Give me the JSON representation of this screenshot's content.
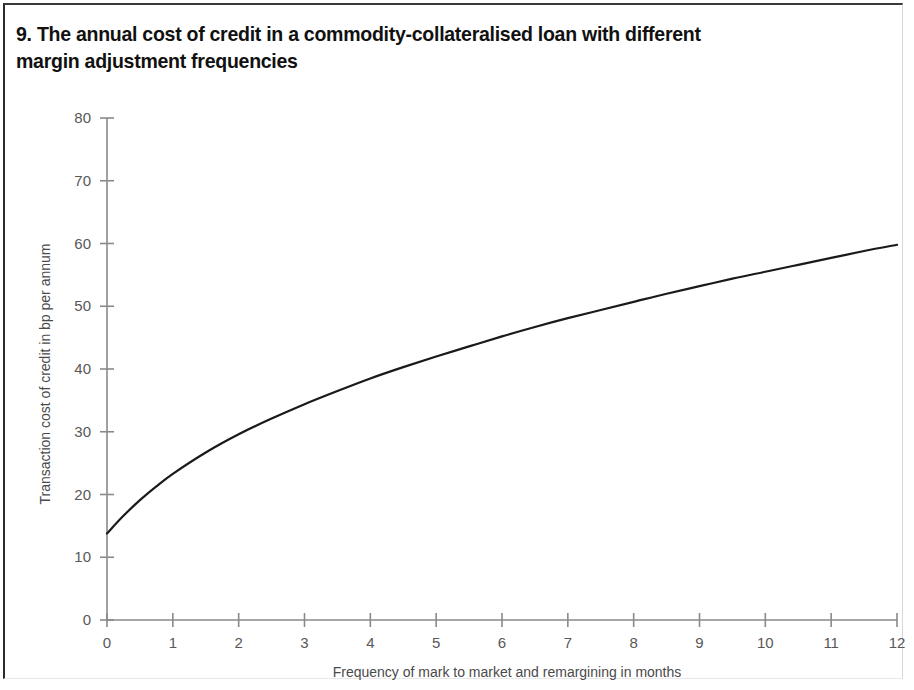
{
  "figure": {
    "title": "9. The annual cost of credit in a commodity-collateralised loan with different margin adjustment frequencies",
    "border_color": "#2b2b2b",
    "background": "#ffffff"
  },
  "chart_data": {
    "type": "line",
    "title": "9. The annual cost of credit in a commodity-collateralised loan with different margin adjustment frequencies",
    "xlabel": "Frequency of mark to market and remargining in months",
    "ylabel": "Transaction cost of credit in bp per  annum",
    "xlim": [
      0,
      12
    ],
    "ylim": [
      0,
      80
    ],
    "xticks": [
      0,
      1,
      2,
      3,
      4,
      5,
      6,
      7,
      8,
      9,
      10,
      11,
      12
    ],
    "yticks": [
      0,
      10,
      20,
      30,
      40,
      50,
      60,
      70,
      80
    ],
    "xtick_labels": [
      "0",
      "1",
      "2",
      "3",
      "4",
      "5",
      "6",
      "7",
      "8",
      "9",
      "10",
      "11",
      "12"
    ],
    "ytick_labels": [
      "0",
      "10",
      "20",
      "30",
      "40",
      "50",
      "60",
      "70",
      "80"
    ],
    "grid": false,
    "legend": null,
    "line_color": "#1a1a1a",
    "line_width": 2.2,
    "axis_color": "#8a8a8a",
    "series": [
      {
        "name": "Annual cost of credit",
        "x": [
          0,
          0.25,
          0.5,
          0.75,
          1,
          1.5,
          2,
          2.5,
          3,
          3.5,
          4,
          4.5,
          5,
          5.5,
          6,
          6.5,
          7,
          7.5,
          8,
          8.5,
          9,
          9.5,
          10,
          10.5,
          11,
          11.5,
          12
        ],
        "values": [
          13.8,
          16.6,
          19.1,
          21.3,
          23.3,
          26.7,
          29.6,
          32.1,
          34.4,
          36.5,
          38.5,
          40.3,
          42.0,
          43.6,
          45.2,
          46.7,
          48.1,
          49.4,
          50.7,
          52.0,
          53.2,
          54.4,
          55.5,
          56.6,
          57.7,
          58.8,
          59.8
        ]
      }
    ]
  },
  "axes": {
    "x_title": "Frequency of mark to market and remargining in months",
    "y_title": "Transaction cost of credit in bp per  annum",
    "x_ticks": [
      "0",
      "1",
      "2",
      "3",
      "4",
      "5",
      "6",
      "7",
      "8",
      "9",
      "10",
      "11",
      "12"
    ],
    "y_ticks": [
      "80",
      "70",
      "60",
      "50",
      "40",
      "30",
      "20",
      "10",
      "0"
    ]
  }
}
